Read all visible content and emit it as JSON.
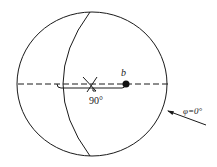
{
  "diagram": {
    "point_label": "b",
    "angle_label": "90°",
    "phi_label": "φ=0°",
    "colors": {
      "stroke": "#1a1a1a",
      "background": "#ffffff"
    }
  }
}
